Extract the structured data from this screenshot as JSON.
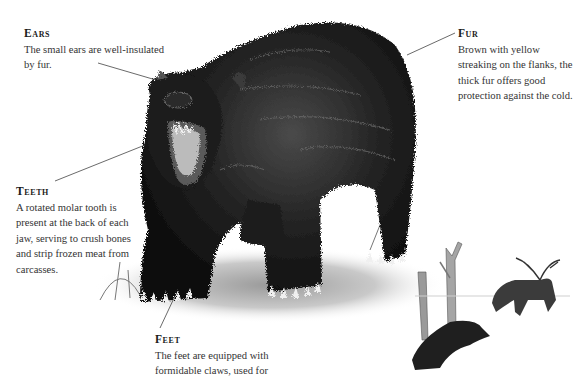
{
  "callouts": {
    "ears": {
      "heading": "Ears",
      "text": "The small ears are well-insulated by fur."
    },
    "fur": {
      "heading": "Fur",
      "text": "Brown with yellow streaking on the flanks, the thick fur offers good protection against the cold."
    },
    "teeth": {
      "heading": "Teeth",
      "text": "A rotated molar tooth is present at the back of each jaw, serving to crush bones and strip frozen meat from carcasses."
    },
    "feet": {
      "heading": "Feet",
      "text": "The feet are equipped with formidable claws, used for"
    }
  },
  "illustration": {
    "subject": "wolverine",
    "background_scene": "wolverine chasing reindeer among bare trees",
    "colors": {
      "fur_dark": "#141414",
      "fur_mid": "#3a3a3a",
      "fur_light": "#7a7a7a",
      "ground": "#c8c8c8",
      "leader_line": "#444444"
    }
  }
}
